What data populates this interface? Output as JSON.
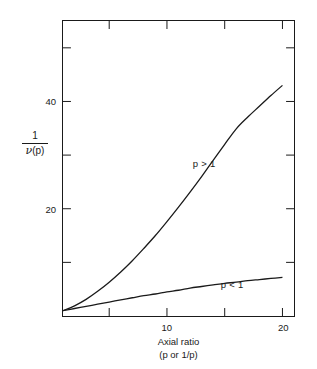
{
  "figure": {
    "background_color": "#ffffff",
    "line_color": "#1a1a1a"
  },
  "chart_data": {
    "type": "line",
    "title": "",
    "subtitle": "",
    "xlabel_lines": [
      "Axial ratio",
      "(p or 1/p)"
    ],
    "xlabel": "Axial ratio (p or 1/p)",
    "ylabel": "1 / ν(p)",
    "ylabel_numerator": "1",
    "ylabel_denominator_symbol": "ν",
    "ylabel_denominator_arg": "(p)",
    "xlim": [
      1,
      21
    ],
    "ylim": [
      0,
      55
    ],
    "grid": false,
    "legend_position": "inline-annotations",
    "x_ticks_labeled": [
      {
        "value": 10,
        "label": "10"
      },
      {
        "value": 20,
        "label": "20"
      }
    ],
    "x_ticks_unlabeled": [
      5,
      15
    ],
    "y_ticks_labeled": [
      {
        "value": 20,
        "label": "20"
      },
      {
        "value": 40,
        "label": "40"
      }
    ],
    "y_ticks_unlabeled": [
      10,
      30,
      50
    ],
    "annotations": [
      {
        "text": "p > 1",
        "x": 13.2,
        "y": 28.5
      },
      {
        "text": "p < 1",
        "x": 15.6,
        "y": 6.2
      }
    ],
    "series": [
      {
        "name": "p > 1",
        "label": "p > 1",
        "x": [
          1,
          2,
          3,
          4,
          5,
          6,
          7,
          8,
          9,
          10,
          11,
          12,
          13,
          14,
          15,
          16,
          17,
          18,
          19,
          20
        ],
        "values": [
          1.0,
          1.9,
          3.1,
          4.6,
          6.3,
          8.2,
          10.3,
          12.6,
          15.0,
          17.6,
          20.3,
          23.1,
          26.0,
          29.0,
          32.0,
          34.9,
          37.1,
          39.1,
          41.1,
          43.0
        ]
      },
      {
        "name": "p < 1",
        "label": "p < 1",
        "x": [
          1,
          2,
          3,
          4,
          5,
          6,
          7,
          8,
          9,
          10,
          11,
          12,
          13,
          14,
          15,
          16,
          17,
          18,
          19,
          20
        ],
        "values": [
          1.0,
          1.4,
          1.8,
          2.2,
          2.6,
          3.0,
          3.4,
          3.8,
          4.1,
          4.5,
          4.8,
          5.2,
          5.5,
          5.8,
          6.1,
          6.3,
          6.6,
          6.8,
          7.0,
          7.2
        ]
      }
    ]
  }
}
